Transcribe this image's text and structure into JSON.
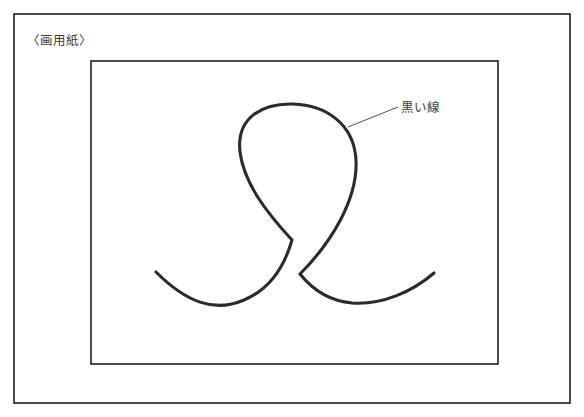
{
  "figure": {
    "background_color": "#ffffff",
    "outer_frame": {
      "name": "outer-border",
      "x": 14,
      "y": 14,
      "width": 556,
      "height": 389,
      "stroke_color": "#231f20"
    },
    "paper_label": {
      "text": "〈画用紙〉",
      "x": 27,
      "y": 41
    },
    "drawing_paper": {
      "name": "drawing-paper-rect",
      "x": 91,
      "y": 61,
      "width": 407,
      "height": 303,
      "stroke_color": "#231f20"
    },
    "black_line": {
      "label": "黒い線",
      "stroke_color": "#2b2b2b",
      "stroke_width": 3.1,
      "description": "単一の連続した曲線。上部に大きなループを描き、下部の交点で交差して左右に尾が伸びる。",
      "path": "M 156 272 C 186 302 214 313 244 300 C 268 290 284 268 292 240 C 268 214 244 184 240 152 C 236 118 262 103 293 104 C 326 105 354 124 356 160 C 358 200 330 244 300 274 C 312 289 330 301 352 303 C 382 305 412 292 434 273",
      "key_points": {
        "left_tail_end": [
          156,
          272
        ],
        "right_tail_end": [
          434,
          273
        ],
        "crossing_point": [
          296,
          297
        ],
        "loop_top": [
          293,
          104
        ],
        "loop_left": [
          238,
          172
        ],
        "loop_right": [
          356,
          176
        ],
        "left_tail_lowest": [
          225,
          303
        ],
        "right_tail_lowest": [
          365,
          303
        ]
      }
    },
    "annotation": {
      "name": "black-line-annotation",
      "text": "黒い線",
      "leader_from": [
        348,
        127
      ],
      "leader_to": [
        398,
        107
      ],
      "text_x": 401,
      "text_y": 108
    }
  }
}
